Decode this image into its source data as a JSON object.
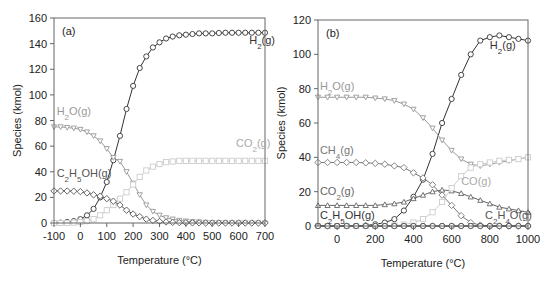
{
  "chart_data": [
    {
      "type": "line",
      "panel_label": "(a)",
      "xlabel": "Temperature (°C)",
      "ylabel": "Species (kmol)",
      "xlim": [
        -100,
        700
      ],
      "ylim": [
        0,
        160
      ],
      "xticks": [
        -100,
        0,
        100,
        200,
        300,
        400,
        500,
        600,
        700
      ],
      "yticks": [
        0,
        20,
        40,
        60,
        80,
        100,
        120,
        140,
        160
      ],
      "grid": false,
      "legend": "none (inline labels)",
      "series": [
        {
          "name": "H2(g)",
          "label_main": "H",
          "label_sub": "2",
          "label_tail": "(g)",
          "color": "#333333",
          "marker": "circle",
          "label_at": [
            640,
            140
          ],
          "x": [
            -100,
            -75,
            -50,
            -25,
            0,
            25,
            50,
            75,
            100,
            125,
            150,
            175,
            200,
            225,
            250,
            275,
            300,
            325,
            350,
            375,
            400,
            425,
            450,
            475,
            500,
            525,
            550,
            575,
            600,
            625,
            650,
            675,
            700
          ],
          "y": [
            0,
            0.3,
            0.8,
            1.5,
            3,
            6,
            11,
            20,
            32,
            49,
            68,
            89,
            107,
            121,
            130,
            137,
            141,
            144,
            145.5,
            146.5,
            147,
            147.5,
            148,
            148,
            148,
            148.3,
            148.5,
            148.5,
            148.5,
            148.5,
            148.5,
            148.5,
            148.5
          ]
        },
        {
          "name": "H2O(g)",
          "label_main": "H",
          "label_sub": "2",
          "label_tail": "O(g)",
          "color": "#999999",
          "marker": "triangle-down",
          "label_at": [
            -90,
            84
          ],
          "x": [
            -100,
            -75,
            -50,
            -25,
            0,
            25,
            50,
            75,
            100,
            125,
            150,
            175,
            200,
            225,
            250,
            275,
            300,
            325,
            350,
            375,
            400,
            425,
            450,
            475,
            500,
            525,
            550,
            575,
            600,
            625,
            650,
            675,
            700
          ],
          "y": [
            75,
            75,
            74.5,
            74,
            73,
            71,
            68,
            64,
            58,
            51,
            48,
            40,
            31,
            22,
            14,
            9,
            6,
            4,
            3,
            2,
            1.5,
            1,
            0.8,
            0.5,
            0.3,
            0.2,
            0.2,
            0.1,
            0.1,
            0.1,
            0,
            0,
            0
          ]
        },
        {
          "name": "CO2(g)",
          "label_main": "CO",
          "label_sub": "2",
          "label_tail": "(g)",
          "color": "#cccccc",
          "marker": "square",
          "label_at": [
            590,
            59
          ],
          "x": [
            -100,
            -75,
            -50,
            -25,
            0,
            25,
            50,
            75,
            100,
            125,
            150,
            175,
            200,
            225,
            250,
            275,
            300,
            325,
            350,
            375,
            400,
            425,
            450,
            475,
            500,
            525,
            550,
            575,
            600,
            625,
            650,
            675,
            700
          ],
          "y": [
            0,
            0,
            0,
            0.3,
            0.8,
            1.5,
            3,
            6,
            10,
            14,
            19,
            24,
            30,
            36,
            41,
            44,
            46,
            47.5,
            48,
            48.5,
            48.5,
            48.5,
            48.5,
            48.5,
            48.5,
            48.5,
            48.5,
            48.5,
            48.5,
            48.5,
            48.5,
            48.5,
            48.5
          ]
        },
        {
          "name": "C2H5OH(g)",
          "label_main": "C",
          "label_sub": "2",
          "label_tail": "H",
          "label_sub2": "5",
          "label_tail2": "OH(g)",
          "color": "#555555",
          "marker": "diamond",
          "label_at": [
            -90,
            36
          ],
          "x": [
            -100,
            -75,
            -50,
            -25,
            0,
            25,
            50,
            75,
            100,
            125,
            150,
            175,
            200,
            225,
            250,
            275,
            300,
            325,
            350,
            375,
            400,
            425,
            450,
            475,
            500,
            525,
            550,
            575,
            600,
            625,
            650,
            675,
            700
          ],
          "y": [
            25,
            25,
            25,
            24.8,
            24.5,
            23.5,
            22,
            21,
            19,
            17,
            14,
            10,
            7,
            5,
            3,
            2,
            1.2,
            0.8,
            0.5,
            0.3,
            0.2,
            0.1,
            0.1,
            0,
            0,
            0,
            0,
            0,
            0,
            0,
            0,
            0,
            0
          ]
        }
      ]
    },
    {
      "type": "line",
      "panel_label": "(b)",
      "xlabel": "Temperature (°C)",
      "ylabel": "Species (kmol)",
      "xlim": [
        -100,
        1000
      ],
      "ylim": [
        0,
        120
      ],
      "xticks": [
        0,
        200,
        400,
        600,
        800,
        1000
      ],
      "yticks": [
        0,
        20,
        40,
        60,
        80,
        100,
        120
      ],
      "grid": false,
      "legend": "none (inline labels)",
      "series": [
        {
          "name": "H2(g)",
          "label_main": "H",
          "label_sub": "2",
          "label_tail": "(g)",
          "color": "#333333",
          "marker": "circle",
          "label_at": [
            800,
            103
          ],
          "x": [
            -100,
            -50,
            0,
            50,
            100,
            150,
            200,
            250,
            300,
            350,
            400,
            450,
            500,
            550,
            600,
            650,
            700,
            750,
            800,
            850,
            900,
            950,
            1000
          ],
          "y": [
            0,
            0,
            0,
            0,
            0,
            0.3,
            1,
            2,
            4,
            9,
            17,
            27,
            42,
            60,
            74,
            88,
            100,
            108,
            110,
            111,
            110,
            109,
            108
          ]
        },
        {
          "name": "H2O(g)",
          "label_main": "H",
          "label_sub": "2",
          "label_tail": "O(g)",
          "color": "#999999",
          "marker": "triangle-down",
          "label_at": [
            -90,
            79
          ],
          "x": [
            -100,
            -50,
            0,
            50,
            100,
            150,
            200,
            250,
            300,
            350,
            400,
            450,
            500,
            550,
            600,
            650,
            700,
            750,
            800,
            850,
            900,
            950,
            1000
          ],
          "y": [
            75,
            75,
            75,
            75,
            75,
            75,
            74.5,
            74,
            73,
            71,
            68,
            63,
            57,
            50,
            44,
            39,
            36,
            35,
            36,
            37,
            38,
            39,
            40
          ]
        },
        {
          "name": "CH4(g)",
          "label_main": "CH",
          "label_sub": "4",
          "label_tail": "(g)",
          "color": "#777777",
          "marker": "diamond",
          "label_at": [
            -90,
            42
          ],
          "x": [
            -100,
            -50,
            0,
            50,
            100,
            150,
            200,
            250,
            300,
            350,
            400,
            450,
            500,
            550,
            600,
            650,
            700,
            750,
            800,
            850,
            900,
            950,
            1000
          ],
          "y": [
            37,
            37,
            37,
            37,
            37,
            36.8,
            36.5,
            36,
            35,
            34,
            31,
            28,
            24,
            18,
            12,
            6,
            2,
            0.5,
            0,
            0,
            0,
            0,
            0
          ]
        },
        {
          "name": "CO2(g)",
          "label_main": "CO",
          "label_sub": "2",
          "label_tail": "(g)",
          "color": "#666666",
          "marker": "triangle-up",
          "label_at": [
            -90,
            18
          ],
          "x": [
            -100,
            -50,
            0,
            50,
            100,
            150,
            200,
            250,
            300,
            350,
            400,
            450,
            500,
            550,
            600,
            650,
            700,
            750,
            800,
            850,
            900,
            950,
            1000
          ],
          "y": [
            12,
            12,
            12,
            12,
            12,
            12,
            12,
            12.5,
            13,
            14,
            16,
            18,
            20,
            21,
            20.5,
            19,
            17,
            15,
            13,
            11,
            10,
            9,
            8
          ]
        },
        {
          "name": "CO(g)",
          "label_main": "CO",
          "label_tail": "(g)",
          "color": "#cccccc",
          "marker": "square",
          "label_at": [
            650,
            24
          ],
          "x": [
            -100,
            -50,
            0,
            50,
            100,
            150,
            200,
            250,
            300,
            350,
            400,
            450,
            500,
            550,
            600,
            650,
            700,
            750,
            800,
            850,
            900,
            950,
            1000
          ],
          "y": [
            0,
            0,
            0,
            0,
            0,
            0,
            0,
            0,
            0.3,
            0.8,
            2,
            4,
            8,
            14,
            22,
            29,
            34,
            36,
            37,
            38,
            38.5,
            39,
            40
          ]
        },
        {
          "name": "C2H5OH(g)",
          "label_main": "C",
          "label_sub": "2",
          "label_tail": "H",
          "label_sub2": "5",
          "label_tail2": "OH(g)",
          "color": "#333333",
          "marker": "circle",
          "label_at": [
            -90,
            4
          ],
          "x": [
            -100,
            -50,
            0,
            50,
            100,
            150,
            200,
            250,
            300,
            350,
            400,
            450,
            500,
            550,
            600,
            650,
            700,
            750,
            800,
            850,
            900,
            950,
            1000
          ],
          "y": [
            0,
            0,
            0,
            0,
            0,
            0,
            0,
            0,
            0,
            0,
            0,
            0,
            0,
            0,
            0,
            0,
            0,
            0,
            0,
            0,
            0,
            0,
            0
          ]
        },
        {
          "name": "C2H4O(g)",
          "label_main": "C",
          "label_sub": "2",
          "label_tail": "H",
          "label_sub2": "4",
          "label_tail2": "O(g)",
          "color": "#555555",
          "marker": "circle",
          "label_at": [
            775,
            4
          ],
          "x": [
            -100,
            -50,
            0,
            50,
            100,
            150,
            200,
            250,
            300,
            350,
            400,
            450,
            500,
            550,
            600,
            650,
            700,
            750,
            800,
            850,
            900,
            950,
            1000
          ],
          "y": [
            0,
            0,
            0,
            0,
            0,
            0,
            0,
            0,
            0,
            0,
            0,
            0,
            0,
            0,
            0,
            0,
            0,
            0,
            0,
            0,
            0,
            0,
            0
          ]
        }
      ]
    }
  ]
}
